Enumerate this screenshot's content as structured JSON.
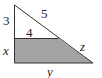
{
  "diagram": {
    "type": "geometry",
    "labels": {
      "top_vertical_leg": "3",
      "top_horizontal_segment": "4",
      "top_hypotenuse": "5",
      "lower_vertical_leg": "x",
      "lower_hypotenuse": "z",
      "base": "y"
    },
    "colors": {
      "shaded_region": "#a3a3a3",
      "lines": "#333333",
      "background": "#ffffff"
    }
  }
}
